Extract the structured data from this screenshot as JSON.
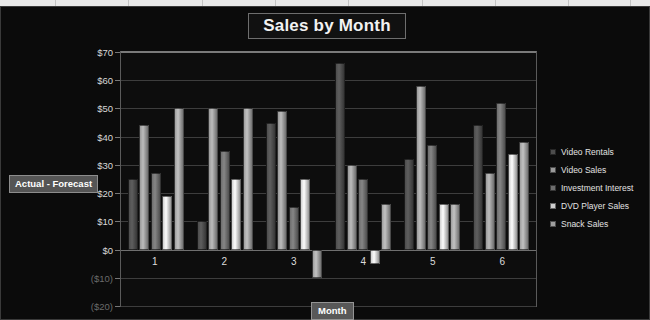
{
  "chart_data": {
    "type": "bar",
    "title": "Sales by Month",
    "xlabel": "Month",
    "ylabel": "Actual - Forecast",
    "categories": [
      "1",
      "2",
      "3",
      "4",
      "5",
      "6"
    ],
    "ylim": [
      -20,
      70
    ],
    "ytick_labels": [
      "$70",
      "$60",
      "$50",
      "$40",
      "$30",
      "$20",
      "$10",
      "$0",
      "($10)",
      "($20)"
    ],
    "ytick_values": [
      70,
      60,
      50,
      40,
      30,
      20,
      10,
      0,
      -10,
      -20
    ],
    "grid": true,
    "legend_position": "right",
    "series": [
      {
        "name": "Video Rentals",
        "color": "#4d4d4d",
        "values": [
          25,
          10,
          45,
          66,
          32,
          44
        ]
      },
      {
        "name": "Video Sales",
        "color": "#9a9a9a",
        "values": [
          44,
          50,
          49,
          30,
          58,
          27
        ]
      },
      {
        "name": "Investment Interest",
        "color": "#6e6e6e",
        "values": [
          27,
          35,
          15,
          25,
          37,
          52
        ]
      },
      {
        "name": "DVD Player Sales",
        "color": "#cfcfcf",
        "values": [
          19,
          25,
          25,
          -5,
          16,
          34
        ]
      },
      {
        "name": "Snack Sales",
        "color": "#9f9f9f",
        "values": [
          50,
          50,
          -10,
          16,
          16,
          38
        ]
      }
    ]
  },
  "colors": {
    "background": "#0b0b0b",
    "plot_background": "#0d0d0d",
    "gridline": "#3d3d3d",
    "text": "#e2e2e2",
    "title_border": "#6e6e6e",
    "axis_title_background": "#565656"
  }
}
